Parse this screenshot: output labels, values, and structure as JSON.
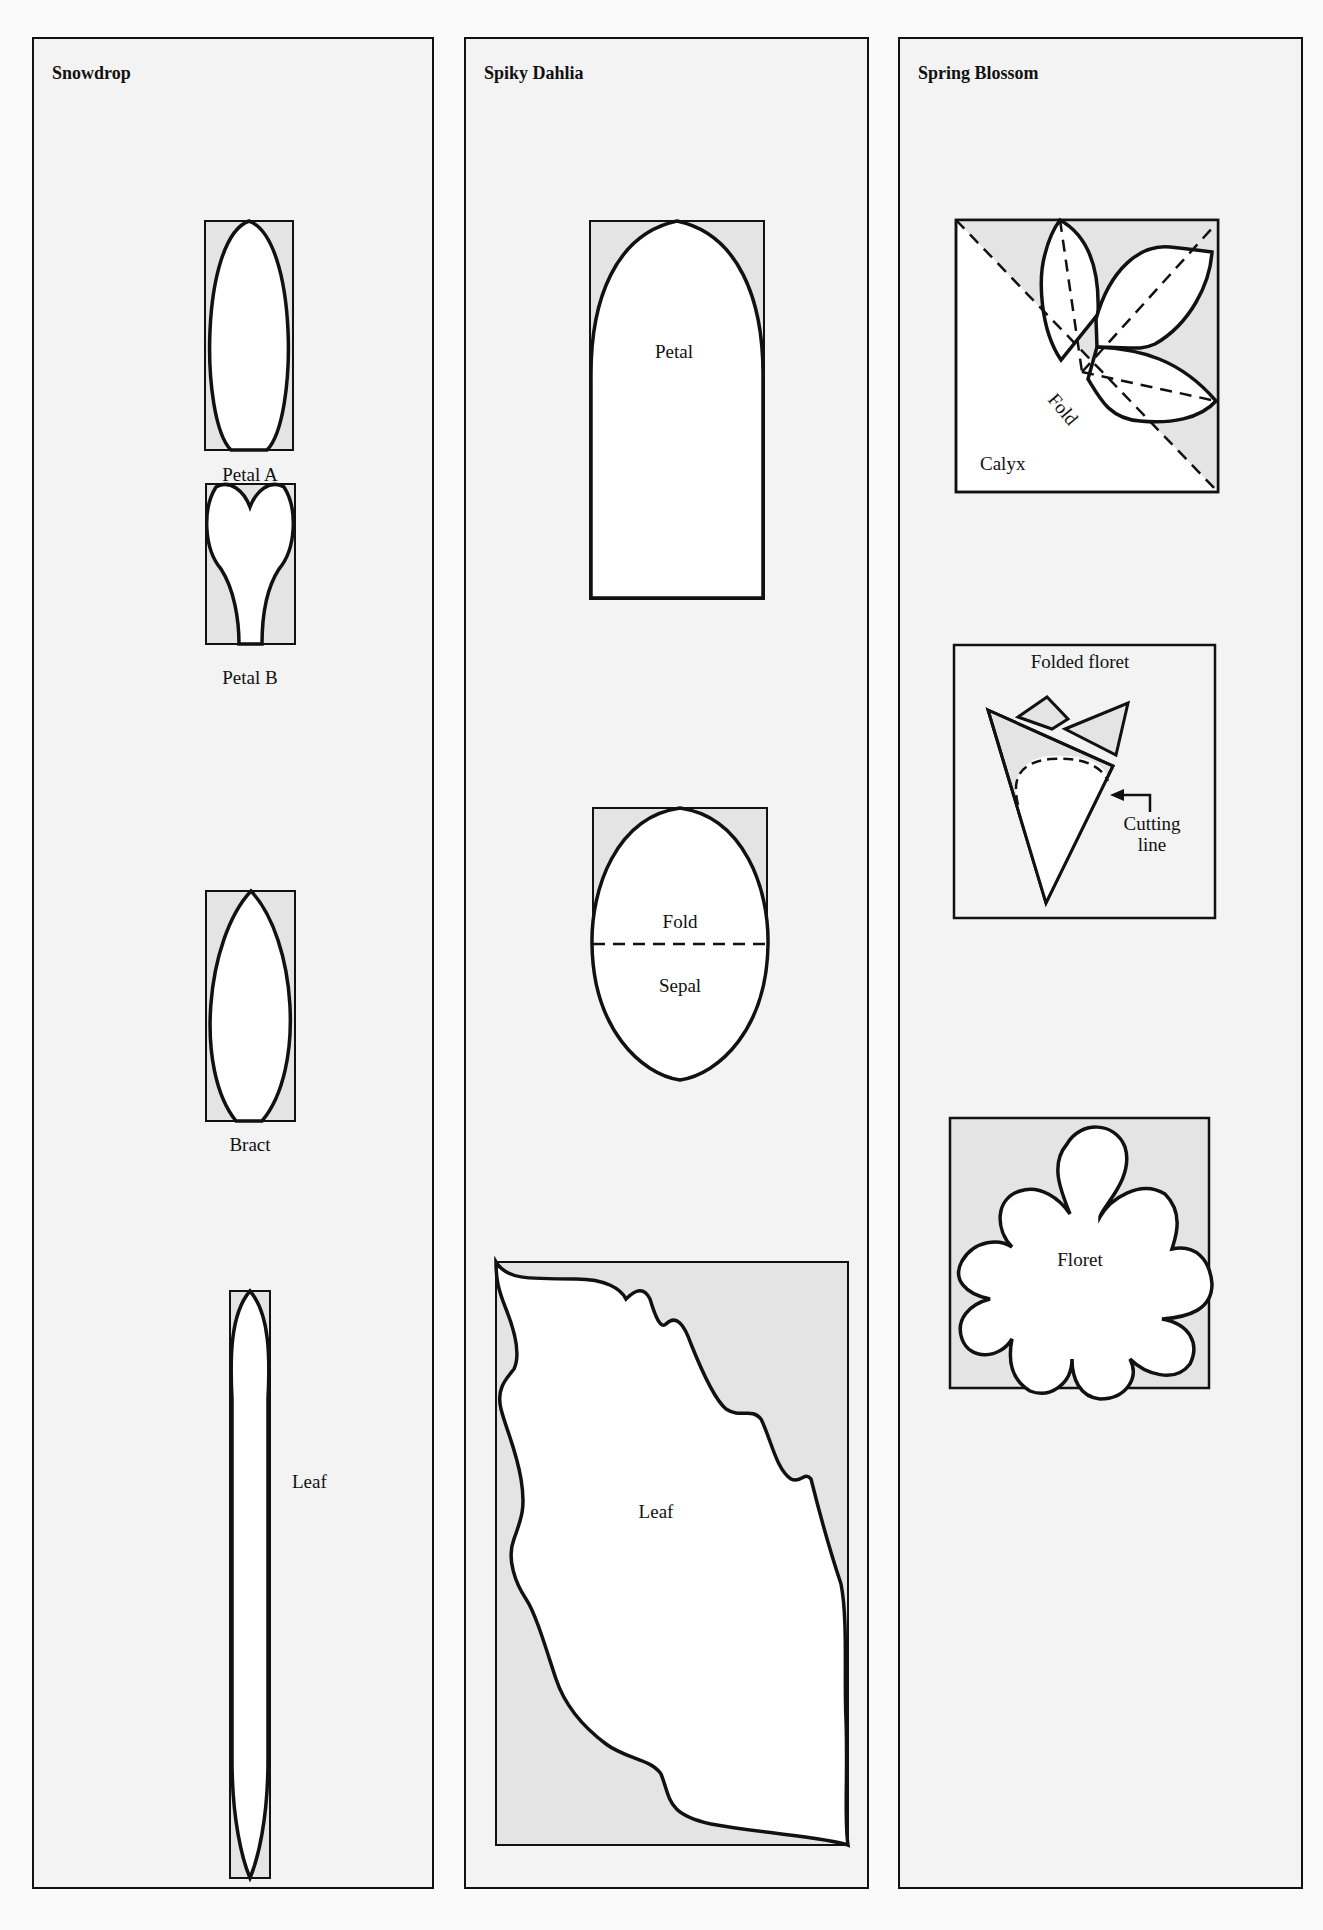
{
  "panels": [
    {
      "title": "Snowdrop",
      "pieces": [
        {
          "label": "Petal A"
        },
        {
          "label": "Petal B"
        },
        {
          "label": "Bract"
        },
        {
          "label": "Leaf"
        }
      ]
    },
    {
      "title": "Spiky Dahlia",
      "pieces": [
        {
          "label": "Petal"
        },
        {
          "label": "Sepal",
          "fold_label": "Fold"
        },
        {
          "label": "Leaf"
        }
      ]
    },
    {
      "title": "Spring Blossom",
      "pieces": [
        {
          "label": "Calyx",
          "fold_label": "Fold"
        },
        {
          "label": "Folded floret",
          "annotation": "Cutting line"
        },
        {
          "label": "Floret"
        }
      ]
    }
  ],
  "colors": {
    "panel_bg": "#f3f3f3",
    "template_shade": "#e4e4e4",
    "cutout": "#ffffff",
    "line": "#111111"
  }
}
